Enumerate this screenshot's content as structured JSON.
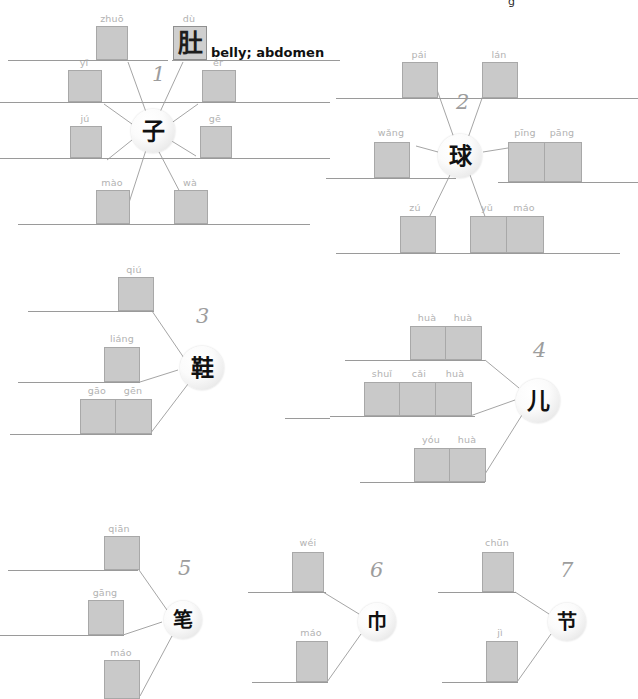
{
  "worksheet": {
    "top_partial_text": "g",
    "example_gloss": "belly; abdomen",
    "colors": {
      "box_fill": "#c9c9c9",
      "box_border": "#a8a8a8",
      "rule": "#9a9a9a",
      "pinyin": "#b2b2b2",
      "number": "#9d9d9d",
      "link": "#a5a5a5",
      "hanzi": "#111111"
    }
  },
  "clusters": [
    {
      "number": "1",
      "center_hanzi": "子",
      "branches": [
        {
          "id": "1-zhuo",
          "pinyin": [
            "zhuō"
          ],
          "filled": false,
          "hanzi": [
            ""
          ]
        },
        {
          "id": "1-du",
          "pinyin": [
            "dù"
          ],
          "filled": true,
          "hanzi": [
            "肚"
          ],
          "gloss": "belly; abdomen"
        },
        {
          "id": "1-yi",
          "pinyin": [
            "yǐ"
          ],
          "filled": false,
          "hanzi": [
            ""
          ]
        },
        {
          "id": "1-er",
          "pinyin": [
            "ér"
          ],
          "filled": false,
          "hanzi": [
            ""
          ]
        },
        {
          "id": "1-ju",
          "pinyin": [
            "jú"
          ],
          "filled": false,
          "hanzi": [
            ""
          ]
        },
        {
          "id": "1-ge",
          "pinyin": [
            "gē"
          ],
          "filled": false,
          "hanzi": [
            ""
          ]
        },
        {
          "id": "1-mao",
          "pinyin": [
            "mào"
          ],
          "filled": false,
          "hanzi": [
            ""
          ]
        },
        {
          "id": "1-wa",
          "pinyin": [
            "wà"
          ],
          "filled": false,
          "hanzi": [
            ""
          ]
        }
      ]
    },
    {
      "number": "2",
      "center_hanzi": "球",
      "branches": [
        {
          "id": "2-pai",
          "pinyin": [
            "pái"
          ],
          "filled": false,
          "hanzi": [
            ""
          ]
        },
        {
          "id": "2-lan",
          "pinyin": [
            "lán"
          ],
          "filled": false,
          "hanzi": [
            ""
          ]
        },
        {
          "id": "2-wang",
          "pinyin": [
            "wǎng"
          ],
          "filled": false,
          "hanzi": [
            ""
          ]
        },
        {
          "id": "2-pingpang",
          "pinyin": [
            "pīng",
            "pāng"
          ],
          "filled": false,
          "hanzi": [
            "",
            ""
          ]
        },
        {
          "id": "2-zu",
          "pinyin": [
            "zú"
          ],
          "filled": false,
          "hanzi": [
            ""
          ]
        },
        {
          "id": "2-yumao",
          "pinyin": [
            "yǔ",
            "máo"
          ],
          "filled": false,
          "hanzi": [
            "",
            ""
          ]
        }
      ]
    },
    {
      "number": "3",
      "center_hanzi": "鞋",
      "branches": [
        {
          "id": "3-qiu",
          "pinyin": [
            "qiú"
          ],
          "filled": false,
          "hanzi": [
            ""
          ]
        },
        {
          "id": "3-liang",
          "pinyin": [
            "liáng"
          ],
          "filled": false,
          "hanzi": [
            ""
          ]
        },
        {
          "id": "3-gaogen",
          "pinyin": [
            "gāo",
            "gēn"
          ],
          "filled": false,
          "hanzi": [
            "",
            ""
          ]
        }
      ]
    },
    {
      "number": "4",
      "center_hanzi": "儿",
      "branches": [
        {
          "id": "4-huahua",
          "pinyin": [
            "huà",
            "huà"
          ],
          "filled": false,
          "hanzi": [
            "",
            ""
          ]
        },
        {
          "id": "4-shuicaihua",
          "pinyin": [
            "shuǐ",
            "cǎi",
            "huà"
          ],
          "filled": false,
          "hanzi": [
            "",
            "",
            ""
          ]
        },
        {
          "id": "4-youhua",
          "pinyin": [
            "yóu",
            "huà"
          ],
          "filled": false,
          "hanzi": [
            "",
            ""
          ]
        }
      ]
    },
    {
      "number": "5",
      "center_hanzi": "笔",
      "branches": [
        {
          "id": "5-qian",
          "pinyin": [
            "qiān"
          ],
          "filled": false,
          "hanzi": [
            ""
          ]
        },
        {
          "id": "5-gang",
          "pinyin": [
            "gāng"
          ],
          "filled": false,
          "hanzi": [
            ""
          ]
        },
        {
          "id": "5-mao",
          "pinyin": [
            "máo"
          ],
          "filled": false,
          "hanzi": [
            ""
          ]
        }
      ]
    },
    {
      "number": "6",
      "center_hanzi": "巾",
      "branches": [
        {
          "id": "6-wei",
          "pinyin": [
            "wéi"
          ],
          "filled": false,
          "hanzi": [
            ""
          ]
        },
        {
          "id": "6-mao",
          "pinyin": [
            "máo"
          ],
          "filled": false,
          "hanzi": [
            ""
          ]
        }
      ]
    },
    {
      "number": "7",
      "center_hanzi": "节",
      "branches": [
        {
          "id": "7-chun",
          "pinyin": [
            "chūn"
          ],
          "filled": false,
          "hanzi": [
            ""
          ]
        },
        {
          "id": "7-ji",
          "pinyin": [
            "jì"
          ],
          "filled": false,
          "hanzi": [
            ""
          ]
        }
      ]
    }
  ]
}
